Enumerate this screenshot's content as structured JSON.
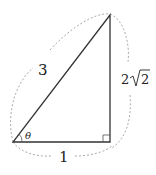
{
  "diagram": {
    "type": "right-triangle",
    "labels": {
      "hypotenuse": "3",
      "opposite_coef": "2",
      "opposite_radicand": "2",
      "adjacent": "1",
      "angle": "θ"
    },
    "colors": {
      "stroke": "#333333",
      "dotted": "#aaaaaa"
    }
  }
}
